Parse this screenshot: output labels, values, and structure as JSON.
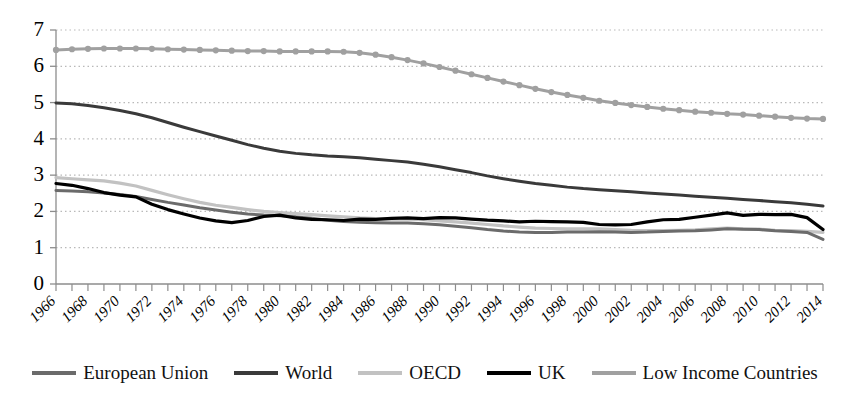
{
  "chart_data": {
    "type": "line",
    "title": "",
    "subtitle": "",
    "xlabel": "",
    "ylabel": "",
    "xlim": [
      1966,
      2014
    ],
    "ylim": [
      0,
      7
    ],
    "y_ticks": [
      0,
      1,
      2,
      3,
      4,
      5,
      6,
      7
    ],
    "grid": true,
    "grid_style": "dotted",
    "legend_position": "bottom",
    "x_tick_labels": [
      "1966",
      "1968",
      "1970",
      "1972",
      "1974",
      "1976",
      "1978",
      "1980",
      "1982",
      "1984",
      "1986",
      "1988",
      "1990",
      "1992",
      "1994",
      "1996",
      "1998",
      "2000",
      "2002",
      "2004",
      "2006",
      "2008",
      "2010",
      "2012",
      "2014"
    ],
    "x": [
      1966,
      1967,
      1968,
      1969,
      1970,
      1971,
      1972,
      1973,
      1974,
      1975,
      1976,
      1977,
      1978,
      1979,
      1980,
      1981,
      1982,
      1983,
      1984,
      1985,
      1986,
      1987,
      1988,
      1989,
      1990,
      1991,
      1992,
      1993,
      1994,
      1995,
      1996,
      1997,
      1998,
      1999,
      2000,
      2001,
      2002,
      2003,
      2004,
      2005,
      2006,
      2007,
      2008,
      2009,
      2010,
      2011,
      2012,
      2013,
      2014
    ],
    "series": [
      {
        "name": "European Union",
        "color": "#6b6b6b",
        "width": 3.0,
        "marker": "none",
        "values": [
          2.58,
          2.56,
          2.54,
          2.51,
          2.47,
          2.41,
          2.33,
          2.25,
          2.18,
          2.1,
          2.04,
          1.98,
          1.93,
          1.9,
          1.88,
          1.85,
          1.81,
          1.76,
          1.72,
          1.7,
          1.69,
          1.68,
          1.68,
          1.66,
          1.63,
          1.59,
          1.55,
          1.5,
          1.46,
          1.43,
          1.42,
          1.42,
          1.43,
          1.43,
          1.44,
          1.43,
          1.42,
          1.43,
          1.45,
          1.46,
          1.47,
          1.49,
          1.52,
          1.51,
          1.5,
          1.47,
          1.45,
          1.42,
          1.23
        ]
      },
      {
        "name": "World",
        "color": "#3a3a3a",
        "width": 3.0,
        "marker": "none",
        "values": [
          4.99,
          4.97,
          4.92,
          4.86,
          4.78,
          4.69,
          4.58,
          4.45,
          4.32,
          4.2,
          4.08,
          3.96,
          3.84,
          3.74,
          3.66,
          3.6,
          3.56,
          3.53,
          3.51,
          3.48,
          3.44,
          3.4,
          3.36,
          3.3,
          3.23,
          3.15,
          3.07,
          2.98,
          2.9,
          2.83,
          2.77,
          2.72,
          2.67,
          2.63,
          2.6,
          2.57,
          2.54,
          2.51,
          2.48,
          2.45,
          2.42,
          2.39,
          2.36,
          2.33,
          2.3,
          2.27,
          2.24,
          2.2,
          2.15
        ]
      },
      {
        "name": "OECD",
        "color": "#c2c2c2",
        "width": 3.2,
        "marker": "none",
        "values": [
          2.93,
          2.9,
          2.87,
          2.84,
          2.78,
          2.7,
          2.58,
          2.46,
          2.35,
          2.25,
          2.17,
          2.11,
          2.05,
          2.0,
          1.97,
          1.94,
          1.91,
          1.88,
          1.85,
          1.82,
          1.8,
          1.79,
          1.79,
          1.77,
          1.74,
          1.71,
          1.68,
          1.64,
          1.6,
          1.57,
          1.54,
          1.53,
          1.52,
          1.52,
          1.52,
          1.5,
          1.48,
          1.47,
          1.47,
          1.48,
          1.49,
          1.52,
          1.54,
          1.52,
          1.51,
          1.48,
          1.47,
          1.45,
          1.42
        ]
      },
      {
        "name": "UK",
        "color": "#000000",
        "width": 3.2,
        "marker": "none",
        "values": [
          2.77,
          2.72,
          2.63,
          2.52,
          2.45,
          2.4,
          2.2,
          2.05,
          1.93,
          1.82,
          1.74,
          1.69,
          1.75,
          1.86,
          1.9,
          1.82,
          1.78,
          1.77,
          1.75,
          1.79,
          1.78,
          1.81,
          1.82,
          1.8,
          1.83,
          1.82,
          1.79,
          1.76,
          1.74,
          1.71,
          1.73,
          1.72,
          1.71,
          1.7,
          1.64,
          1.63,
          1.64,
          1.71,
          1.77,
          1.78,
          1.84,
          1.9,
          1.96,
          1.89,
          1.92,
          1.91,
          1.92,
          1.83,
          1.5
        ]
      },
      {
        "name": "Low Income Countries",
        "color": "#a0a0a0",
        "width": 3.0,
        "marker": "circle",
        "values": [
          6.45,
          6.47,
          6.48,
          6.49,
          6.49,
          6.49,
          6.48,
          6.47,
          6.46,
          6.45,
          6.44,
          6.43,
          6.42,
          6.42,
          6.41,
          6.41,
          6.41,
          6.41,
          6.4,
          6.37,
          6.32,
          6.25,
          6.17,
          6.08,
          5.98,
          5.88,
          5.78,
          5.68,
          5.58,
          5.48,
          5.38,
          5.29,
          5.21,
          5.13,
          5.05,
          4.99,
          4.93,
          4.88,
          4.83,
          4.79,
          4.75,
          4.72,
          4.69,
          4.67,
          4.64,
          4.61,
          4.58,
          4.56,
          4.55
        ]
      }
    ]
  },
  "legend": {
    "items": [
      {
        "label": "European Union"
      },
      {
        "label": "World"
      },
      {
        "label": "OECD"
      },
      {
        "label": "UK"
      },
      {
        "label": "Low Income Countries"
      }
    ]
  }
}
